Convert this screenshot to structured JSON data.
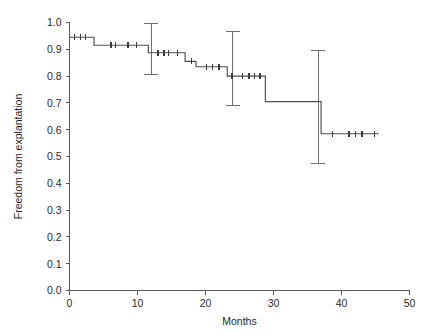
{
  "chart_data": {
    "type": "line",
    "subtype": "kaplan-meier-survival-step",
    "title": "",
    "xlabel": "Months",
    "ylabel": "Freedom from explantation",
    "xlim": [
      0,
      50
    ],
    "ylim": [
      0.0,
      1.0
    ],
    "xticks": [
      0,
      10,
      20,
      30,
      40,
      50
    ],
    "xticklabels": [
      "0",
      "10",
      "20",
      "30",
      "40",
      "50"
    ],
    "yticks": [
      0.0,
      0.1,
      0.2,
      0.3,
      0.4,
      0.5,
      0.6,
      0.7,
      0.8,
      0.9,
      1.0
    ],
    "yticklabels": [
      "0.0",
      "0.1",
      "0.2",
      "0.3",
      "0.4",
      "0.5",
      "0.6",
      "0.7",
      "0.8",
      "0.9",
      "1.0"
    ],
    "grid": false,
    "legend": false,
    "legend_position": "none",
    "series": [
      {
        "name": "Freedom from explantation",
        "step_points": [
          {
            "x": 0.0,
            "y": 0.945
          },
          {
            "x": 3.6,
            "y": 0.945
          },
          {
            "x": 3.6,
            "y": 0.915
          },
          {
            "x": 11.6,
            "y": 0.915
          },
          {
            "x": 11.6,
            "y": 0.887
          },
          {
            "x": 17.0,
            "y": 0.887
          },
          {
            "x": 17.0,
            "y": 0.855
          },
          {
            "x": 18.6,
            "y": 0.855
          },
          {
            "x": 18.6,
            "y": 0.835
          },
          {
            "x": 23.2,
            "y": 0.835
          },
          {
            "x": 23.2,
            "y": 0.8
          },
          {
            "x": 28.8,
            "y": 0.8
          },
          {
            "x": 28.8,
            "y": 0.705
          },
          {
            "x": 37.0,
            "y": 0.705
          },
          {
            "x": 37.0,
            "y": 0.585
          },
          {
            "x": 45.5,
            "y": 0.585
          }
        ],
        "censor_marks": [
          {
            "x": 0.7,
            "y": 0.945
          },
          {
            "x": 1.6,
            "y": 0.945
          },
          {
            "x": 2.4,
            "y": 0.945
          },
          {
            "x": 6.1,
            "y": 0.915
          },
          {
            "x": 6.8,
            "y": 0.915
          },
          {
            "x": 8.6,
            "y": 0.915
          },
          {
            "x": 9.8,
            "y": 0.915
          },
          {
            "x": 13.0,
            "y": 0.887
          },
          {
            "x": 13.9,
            "y": 0.887
          },
          {
            "x": 14.6,
            "y": 0.887
          },
          {
            "x": 15.9,
            "y": 0.887
          },
          {
            "x": 17.9,
            "y": 0.855
          },
          {
            "x": 20.1,
            "y": 0.835
          },
          {
            "x": 21.0,
            "y": 0.835
          },
          {
            "x": 22.0,
            "y": 0.835
          },
          {
            "x": 23.9,
            "y": 0.8
          },
          {
            "x": 25.4,
            "y": 0.8
          },
          {
            "x": 26.4,
            "y": 0.8
          },
          {
            "x": 27.2,
            "y": 0.8
          },
          {
            "x": 28.0,
            "y": 0.8
          },
          {
            "x": 38.7,
            "y": 0.585
          },
          {
            "x": 41.1,
            "y": 0.585
          },
          {
            "x": 42.1,
            "y": 0.585
          },
          {
            "x": 43.0,
            "y": 0.585
          },
          {
            "x": 44.9,
            "y": 0.585
          }
        ],
        "error_bars": [
          {
            "x": 12.0,
            "y": 0.887,
            "lower": 0.805,
            "upper": 0.995
          },
          {
            "x": 24.0,
            "y": 0.8,
            "lower": 0.69,
            "upper": 0.968
          },
          {
            "x": 36.6,
            "y": 0.705,
            "lower": 0.475,
            "upper": 0.895
          }
        ]
      }
    ]
  },
  "axes": {
    "x_title": "Months",
    "y_title": "Freedom from explantation"
  },
  "colors": {
    "curve": "#4d4d4d",
    "axis": "#5a5a5a",
    "errorbar": "#6e6e6e",
    "text": "#2b2b2b",
    "background": "#ffffff"
  }
}
